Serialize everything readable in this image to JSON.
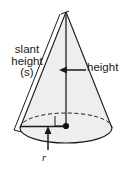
{
  "figure": {
    "type": "geometry-diagram",
    "shape": "cone",
    "background_color": "#ffffff",
    "body_fill_color": "#eeeeee",
    "outline_color": "#1a1a1a",
    "text_color": "#1a1a1a",
    "labels": {
      "slant_line1": "slant",
      "slant_line2": "height",
      "slant_line3": "(s)",
      "height": "height",
      "radius": "r"
    },
    "annotations": {
      "height_arrow": "arrow-pointing-left-to-axis",
      "radius_arrow": "arrow-pointing-up-to-base-radius",
      "slant_bracket": "bracket-along-left-slant-edge",
      "right_angle": "right-angle-marker-at-base-center",
      "hidden_edge": "dashed-back-half-of-base-ellipse",
      "apex_point": "cone-apex",
      "center_point": "base-center-dot"
    }
  }
}
